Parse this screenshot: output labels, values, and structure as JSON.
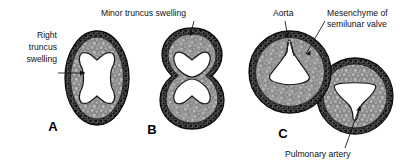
{
  "figure": {
    "background_color": "#ffffff",
    "ink_color": "#111111",
    "mesenchyme_color": "#9e9e9e",
    "wall_color": "#3a3a3a",
    "lumen_color": "#ffffff"
  },
  "panels": [
    {
      "id": "A",
      "letter": "A",
      "shape": "oval",
      "lumen_count": 1,
      "lumen_shape": "bowtie",
      "cx": 97,
      "cy": 78,
      "rx": 32,
      "ry": 47,
      "letter_x": 53,
      "letter_y": 131
    },
    {
      "id": "B",
      "letter": "B",
      "shape": "figure-eight",
      "lumen_count": 2,
      "lumen_shape": "trefoil",
      "cx": 192,
      "cy": 78,
      "letter_x": 152,
      "letter_y": 134
    },
    {
      "id": "C",
      "letter": "C",
      "shape": "two-overlapping-circles",
      "lumen_count": 2,
      "lumen_shape": "triangular",
      "left_cx": 290,
      "left_cy": 72,
      "left_r": 41,
      "right_cx": 355,
      "right_cy": 96,
      "right_r": 38,
      "letter_x": 283,
      "letter_y": 138
    }
  ],
  "labels": [
    {
      "name": "right-truncus-swelling",
      "lines": [
        "Right",
        "truncus",
        "swelling"
      ],
      "align": "right",
      "x": 57,
      "y": 38,
      "line_height": 12,
      "leader": "M58,73 L85,73",
      "arrow": "M85,73 l-5,-2.4 l0,4.8 z"
    },
    {
      "name": "minor-truncus-swelling",
      "lines": [
        "Minor truncus swelling"
      ],
      "align": "left",
      "x": 101,
      "y": 16,
      "line_height": 12,
      "leader": "M194,21 L190,36",
      "arrow": "M190,36 l4.6,-3.1 l-4.2,-1.9 z"
    },
    {
      "name": "aorta",
      "lines": [
        "Aorta"
      ],
      "align": "left",
      "x": 273,
      "y": 16,
      "line_height": 12,
      "leader": "M285,21 L288,38",
      "arrow": "M288,38 l0.4,-5.6 l-4.2,2.6 z"
    },
    {
      "name": "mesenchyme-of-semilunar-valve",
      "lines": [
        "Mesenchyme of",
        "semilunar valve"
      ],
      "align": "left",
      "x": 327,
      "y": 16,
      "line_height": 11,
      "leader": "M325,21 L306,54",
      "arrow": "M306,54 l4.6,-3.4 l-0.6,4.9 z"
    },
    {
      "name": "pulmonary-artery",
      "lines": [
        "Pulmonary artery"
      ],
      "align": "left",
      "x": 285,
      "y": 155,
      "line_height": 12,
      "leader": "M360,106 L345,148",
      "arrow": "M360,106 l-3.6,4.2 l4.9,0.4 z"
    }
  ]
}
